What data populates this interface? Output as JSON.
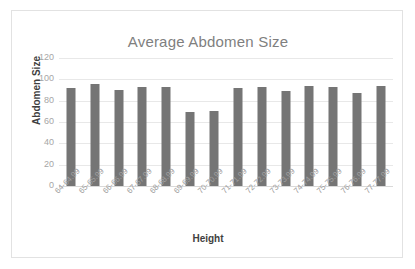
{
  "chart_data": {
    "type": "bar",
    "title": "Average Abdomen Size",
    "xlabel": "Height",
    "ylabel": "Abdomen Size",
    "categories": [
      "64-64.99",
      "65-65.99",
      "66-66.99",
      "67-67.99",
      "68-68.99",
      "69-69.99",
      "70-70.99",
      "71-71.99",
      "72-72.99",
      "73-73.99",
      "74-74.99",
      "75-75.99",
      "76-76.99",
      "77-77.99"
    ],
    "values": [
      92,
      96,
      90,
      92.5,
      93,
      69.5,
      70,
      91.5,
      92.5,
      89,
      94,
      92.5,
      87,
      94
    ],
    "ylim": [
      0,
      120
    ],
    "yticks": [
      0,
      20,
      40,
      60,
      80,
      100,
      120
    ],
    "ytick_labels": [
      "0",
      "20",
      "40",
      "60",
      "80",
      "100",
      "120"
    ],
    "grid": true,
    "legend": false,
    "bar_color": "#757575",
    "title_color": "#7f7f7f",
    "gridline_color": "#e8e8e8",
    "tick_label_color": "#a6a6a6",
    "axis_title_color": "#3f3f3f",
    "border_color": "#e2e2e2"
  }
}
